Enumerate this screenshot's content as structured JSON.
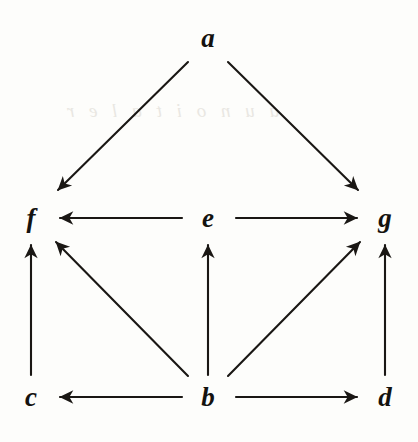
{
  "diagram": {
    "type": "directed-graph",
    "width": 418,
    "height": 442,
    "background_color": "#fdfdfb",
    "stroke_color": "#1a1714",
    "label_color": "#14120f",
    "stroke_width": 2.1,
    "nodes": [
      {
        "id": "a",
        "label": "a",
        "x": 208,
        "y": 38,
        "row": "top"
      },
      {
        "id": "f",
        "label": "f",
        "x": 31,
        "y": 218,
        "row": "middle"
      },
      {
        "id": "e",
        "label": "e",
        "x": 208,
        "y": 218,
        "row": "middle"
      },
      {
        "id": "g",
        "label": "g",
        "x": 385,
        "y": 218,
        "row": "middle"
      },
      {
        "id": "c",
        "label": "c",
        "x": 31,
        "y": 397,
        "row": "bottom"
      },
      {
        "id": "b",
        "label": "b",
        "x": 208,
        "y": 397,
        "row": "bottom"
      },
      {
        "id": "d",
        "label": "d",
        "x": 385,
        "y": 397,
        "row": "bottom"
      }
    ],
    "edges": [
      {
        "id": "a-f",
        "from": "a",
        "to": "f",
        "x1": 188,
        "y1": 62,
        "x2": 58,
        "y2": 190,
        "kind": "diagonal-down-left"
      },
      {
        "id": "a-g",
        "from": "a",
        "to": "g",
        "x1": 228,
        "y1": 62,
        "x2": 358,
        "y2": 190,
        "kind": "diagonal-down-right"
      },
      {
        "id": "e-f",
        "from": "e",
        "to": "f",
        "x1": 182,
        "y1": 218,
        "x2": 60,
        "y2": 218,
        "kind": "horizontal-left"
      },
      {
        "id": "e-g",
        "from": "e",
        "to": "g",
        "x1": 236,
        "y1": 218,
        "x2": 357,
        "y2": 218,
        "kind": "horizontal-right"
      },
      {
        "id": "c-f",
        "from": "c",
        "to": "f",
        "x1": 31,
        "y1": 375,
        "x2": 31,
        "y2": 245,
        "kind": "vertical-up"
      },
      {
        "id": "b-f",
        "from": "b",
        "to": "f",
        "x1": 188,
        "y1": 376,
        "x2": 56,
        "y2": 242,
        "kind": "diagonal-up-left"
      },
      {
        "id": "b-e",
        "from": "b",
        "to": "e",
        "x1": 208,
        "y1": 375,
        "x2": 208,
        "y2": 245,
        "kind": "vertical-up"
      },
      {
        "id": "b-g",
        "from": "b",
        "to": "g",
        "x1": 228,
        "y1": 376,
        "x2": 360,
        "y2": 242,
        "kind": "diagonal-up-right"
      },
      {
        "id": "d-g",
        "from": "d",
        "to": "g",
        "x1": 385,
        "y1": 375,
        "x2": 385,
        "y2": 245,
        "kind": "vertical-up"
      },
      {
        "id": "b-c",
        "from": "b",
        "to": "c",
        "x1": 182,
        "y1": 397,
        "x2": 60,
        "y2": 397,
        "kind": "horizontal-left"
      },
      {
        "id": "b-d",
        "from": "b",
        "to": "d",
        "x1": 236,
        "y1": 397,
        "x2": 357,
        "y2": 397,
        "kind": "horizontal-right"
      }
    ],
    "artifacts": [
      {
        "id": "bleed-1",
        "text": "a u n o i t a l e r",
        "x": 62,
        "y": 100,
        "note": "faint show-through from reverse of scanned page"
      }
    ]
  }
}
